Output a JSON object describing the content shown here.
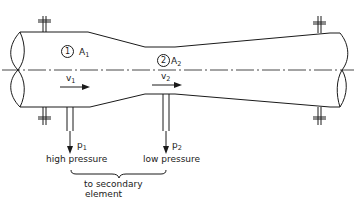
{
  "diagram": {
    "type": "venturi-meter-schematic",
    "sections": [
      {
        "marker": "1",
        "area_label": "A",
        "area_sub": "1",
        "velocity_label": "v",
        "velocity_sub": "1"
      },
      {
        "marker": "2",
        "area_label": "A",
        "area_sub": "2",
        "velocity_label": "v",
        "velocity_sub": "2"
      }
    ],
    "taps": [
      {
        "pressure_label": "p",
        "pressure_sub": "1",
        "description": "high pressure"
      },
      {
        "pressure_label": "p",
        "pressure_sub": "2",
        "description": "low pressure"
      }
    ],
    "brace_label_line1": "to secondary",
    "brace_label_line2": "element",
    "colors": {
      "line": "#1a1a1a",
      "background": "#ffffff"
    }
  }
}
